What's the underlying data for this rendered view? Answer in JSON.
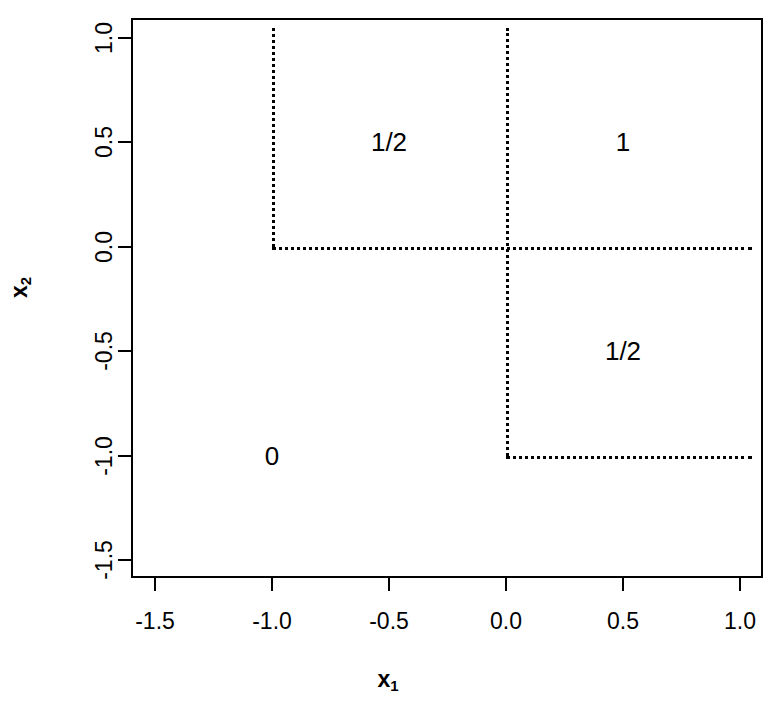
{
  "chart_data": {
    "type": "line",
    "title": "",
    "subtitle": "",
    "xlabel": "x1",
    "ylabel": "x2",
    "xlabel_base": "x",
    "xlabel_sub": "1",
    "ylabel_base": "x",
    "ylabel_sub": "2",
    "xlim": [
      -1.7,
      1.1
    ],
    "ylim": [
      -1.65,
      1.1
    ],
    "grid": false,
    "legend": "none",
    "xticks": [
      -1.5,
      -1.0,
      -0.5,
      0.0,
      0.5,
      1.0
    ],
    "xticklabels": [
      "-1.5",
      "-1.0",
      "-0.5",
      "0.0",
      "0.5",
      "1.0"
    ],
    "yticks": [
      1.0,
      0.5,
      0.0,
      -0.5,
      -1.0,
      -1.5
    ],
    "yticklabels": [
      "1.0",
      "0.5",
      "0.0",
      "-0.5",
      "-1.0",
      "-1.5"
    ],
    "line_style": "dotted",
    "line_color": "#000000",
    "frame_color": "#000000",
    "background": "#ffffff",
    "segments": [
      {
        "name": "vertical-at-x-minus-1",
        "orientation": "vertical",
        "x": -1.0,
        "y_start": 1.05,
        "y_end": 0.0
      },
      {
        "name": "horizontal-at-y-0",
        "orientation": "horizontal",
        "y": 0.0,
        "x_start": -1.0,
        "x_end": 1.05
      },
      {
        "name": "vertical-at-x-0",
        "orientation": "vertical",
        "x": 0.0,
        "y_start": 1.05,
        "y_end": -1.0
      },
      {
        "name": "horizontal-at-y-minus-1",
        "orientation": "horizontal",
        "y": -1.0,
        "x_start": 0.0,
        "x_end": 1.05
      }
    ],
    "annotations": [
      {
        "name": "region-value-upper-left",
        "text": "1/2",
        "x": -0.5,
        "y": 0.5
      },
      {
        "name": "region-value-upper-right",
        "text": "1",
        "x": 0.5,
        "y": 0.5
      },
      {
        "name": "region-value-lower-right",
        "text": "1/2",
        "x": 0.5,
        "y": -0.5
      },
      {
        "name": "region-value-lower-left",
        "text": "0",
        "x": -1.0,
        "y": -1.0
      }
    ]
  }
}
